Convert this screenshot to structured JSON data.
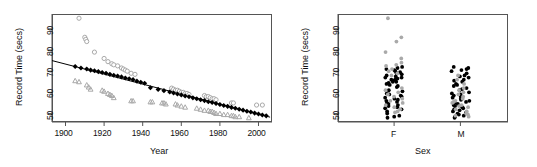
{
  "figure": {
    "type": "multi-panel-r-base-plot",
    "panels": 2,
    "background": "#ffffff",
    "colors": {
      "point_black": "#000000",
      "point_gray": "#a9a9a9",
      "axis": "#555555",
      "text": "#111111"
    }
  },
  "chart_data": [
    {
      "type": "scatter",
      "panel": "left",
      "title": "",
      "xlabel": "Year",
      "ylabel": "Record Time (secs)",
      "xlim": [
        1893,
        2007
      ],
      "ylim": [
        46,
        97
      ],
      "xticks": [
        1900,
        1920,
        1940,
        1960,
        1980,
        2000
      ],
      "xtick_labels": [
        "1900",
        "1920",
        "1940",
        "1960",
        "1980",
        "2000"
      ],
      "yticks": [
        50,
        60,
        70,
        80,
        90
      ],
      "ytick_labels": [
        "50",
        "60",
        "70",
        "80",
        "90"
      ],
      "grid": false,
      "legend": "none",
      "series": [
        {
          "name": "gray-circles",
          "marker": "circle",
          "color": "#a9a9a9",
          "points": [
            [
              1907,
              95.0
            ],
            [
              1910,
              86.0
            ],
            [
              1910.5,
              85.0
            ],
            [
              1911,
              84.0
            ],
            [
              1915,
              79.0
            ],
            [
              1920,
              76.0
            ],
            [
              1922,
              74.5
            ],
            [
              1924,
              73.5
            ],
            [
              1925,
              73.0
            ],
            [
              1927,
              72.5
            ],
            [
              1929,
              71.5
            ],
            [
              1930,
              71.0
            ],
            [
              1931,
              70.5
            ],
            [
              1932,
              70.0
            ],
            [
              1934,
              69.0
            ],
            [
              1936,
              68.5
            ],
            [
              1955,
              62.0
            ],
            [
              1956,
              61.5
            ],
            [
              1957,
              61.0
            ],
            [
              1958,
              61.0
            ],
            [
              1959,
              60.5
            ],
            [
              1960,
              60.0
            ],
            [
              1961,
              60.0
            ],
            [
              1962,
              59.5
            ],
            [
              1963,
              59.5
            ],
            [
              1964,
              59.0
            ],
            [
              1972,
              58.5
            ],
            [
              1973,
              58.0
            ],
            [
              1974,
              58.0
            ],
            [
              1975,
              57.5
            ],
            [
              1976,
              57.0
            ],
            [
              1977,
              57.0
            ],
            [
              1978,
              56.5
            ],
            [
              1986,
              55.0
            ],
            [
              1987,
              55.0
            ],
            [
              1999,
              54.0
            ],
            [
              2002,
              54.0
            ]
          ]
        },
        {
          "name": "gray-triangles",
          "marker": "triangle",
          "color": "#a9a9a9",
          "points": [
            [
              1905,
              65.5
            ],
            [
              1907,
              65.0
            ],
            [
              1911,
              63.5
            ],
            [
              1912,
              62.5
            ],
            [
              1913,
              61.5
            ],
            [
              1919,
              61.0
            ],
            [
              1920,
              60.5
            ],
            [
              1922,
              59.5
            ],
            [
              1923,
              59.0
            ],
            [
              1924,
              58.5
            ],
            [
              1925,
              57.5
            ],
            [
              1934,
              56.0
            ],
            [
              1935,
              56.0
            ],
            [
              1944,
              55.5
            ],
            [
              1945,
              55.5
            ],
            [
              1950,
              55.0
            ],
            [
              1951,
              55.0
            ],
            [
              1952,
              54.5
            ],
            [
              1957,
              54.5
            ],
            [
              1958,
              54.0
            ],
            [
              1960,
              53.5
            ],
            [
              1962,
              53.0
            ],
            [
              1968,
              52.5
            ],
            [
              1970,
              52.0
            ],
            [
              1972,
              51.5
            ],
            [
              1974,
              51.5
            ],
            [
              1975,
              51.0
            ],
            [
              1976,
              51.0
            ],
            [
              1977,
              50.5
            ],
            [
              1978,
              50.0
            ],
            [
              1980,
              50.0
            ],
            [
              1982,
              49.5
            ],
            [
              1984,
              49.5
            ],
            [
              1986,
              49.0
            ],
            [
              1987,
              49.0
            ],
            [
              1988,
              48.5
            ],
            [
              1990,
              48.5
            ],
            [
              1995,
              48.0
            ]
          ]
        },
        {
          "name": "black-fitted-points",
          "marker": "diamond",
          "color": "#000000",
          "points": [
            [
              1905,
              72.2
            ],
            [
              1908,
              71.5
            ],
            [
              1911,
              71.0
            ],
            [
              1913,
              70.5
            ],
            [
              1915,
              70.2
            ],
            [
              1917,
              69.8
            ],
            [
              1919,
              69.4
            ],
            [
              1921,
              69.0
            ],
            [
              1923,
              68.5
            ],
            [
              1925,
              68.1
            ],
            [
              1927,
              67.7
            ],
            [
              1929,
              67.3
            ],
            [
              1931,
              66.8
            ],
            [
              1933,
              66.4
            ],
            [
              1935,
              66.0
            ],
            [
              1937,
              65.3
            ],
            [
              1939,
              64.8
            ],
            [
              1941,
              64.3
            ],
            [
              1944,
              62.2
            ],
            [
              1948,
              61.4
            ],
            [
              1951,
              60.8
            ],
            [
              1954,
              60.2
            ],
            [
              1956,
              59.7
            ],
            [
              1958,
              59.2
            ],
            [
              1960,
              58.8
            ],
            [
              1962,
              58.3
            ],
            [
              1964,
              57.9
            ],
            [
              1966,
              57.4
            ],
            [
              1968,
              57.0
            ],
            [
              1970,
              56.5
            ],
            [
              1972,
              56.1
            ],
            [
              1974,
              55.6
            ],
            [
              1976,
              55.2
            ],
            [
              1978,
              54.7
            ],
            [
              1980,
              54.3
            ],
            [
              1982,
              53.8
            ],
            [
              1984,
              53.4
            ],
            [
              1986,
              52.9
            ],
            [
              1988,
              52.5
            ],
            [
              1990,
              52.0
            ],
            [
              1992,
              51.6
            ],
            [
              1994,
              51.1
            ],
            [
              1996,
              50.7
            ],
            [
              1998,
              50.2
            ],
            [
              2000,
              49.8
            ],
            [
              2002,
              49.3
            ],
            [
              2004,
              48.9
            ]
          ]
        }
      ],
      "fit_line": {
        "name": "regression-line",
        "x": [
          1893,
          2006
        ],
        "y": [
          75.0,
          48.3
        ],
        "color": "#000000"
      }
    },
    {
      "type": "scatter",
      "panel": "right",
      "title": "",
      "xlabel": "Sex",
      "ylabel": "Record Time (secs)",
      "categories": [
        "F",
        "M"
      ],
      "ylim": [
        46,
        97
      ],
      "yticks": [
        50,
        60,
        70,
        80,
        90
      ],
      "ytick_labels": [
        "50",
        "60",
        "70",
        "80",
        "90"
      ],
      "grid": false,
      "legend": "none",
      "groups": [
        {
          "name": "F",
          "black_values": [
            72.0,
            71.5,
            71.0,
            70.5,
            70.0,
            69.5,
            69.0,
            68.5,
            68.0,
            67.5,
            67.0,
            67.0,
            66.5,
            66.0,
            66.0,
            65.5,
            65.0,
            65.0,
            64.5,
            64.0,
            63.5,
            63.0,
            62.5,
            61.0,
            60.5,
            59.5,
            59.0,
            58.5,
            58.0,
            57.5,
            57.0,
            56.5,
            56.0,
            55.5,
            55.0,
            54.5,
            54.0,
            53.5,
            53.0,
            52.5,
            52.0,
            51.0,
            50.0,
            49.0,
            48.5,
            48.0
          ],
          "gray_values": [
            95.0,
            86.0,
            84.0,
            79.0,
            76.0,
            74.0,
            73.0,
            72.5,
            71.0,
            70.0,
            69.0,
            68.0,
            62.0,
            61.0,
            60.0,
            59.0,
            58.0,
            57.0,
            56.0,
            55.0,
            54.0,
            53.0,
            52.0,
            51.0,
            50.5
          ]
        },
        {
          "name": "M",
          "black_values": [
            72.0,
            71.5,
            71.0,
            70.5,
            70.0,
            69.0,
            68.0,
            67.5,
            67.0,
            66.0,
            65.5,
            65.0,
            64.0,
            63.5,
            63.0,
            62.0,
            61.5,
            61.0,
            60.0,
            59.5,
            59.0,
            58.5,
            58.0,
            57.5,
            57.0,
            56.5,
            56.0,
            55.5,
            55.0,
            54.5,
            54.0,
            53.5,
            53.0,
            52.5,
            52.0,
            51.5,
            51.0,
            50.5,
            50.0,
            49.5,
            49.0,
            48.5,
            48.0
          ],
          "gray_values": [
            68.0,
            66.0,
            64.0,
            62.0,
            61.0,
            60.0,
            59.0,
            58.0,
            57.0,
            56.0,
            55.5,
            55.0,
            54.0,
            53.5,
            53.0,
            52.0,
            51.0,
            50.0,
            49.5,
            49.0,
            48.5
          ]
        }
      ]
    }
  ]
}
